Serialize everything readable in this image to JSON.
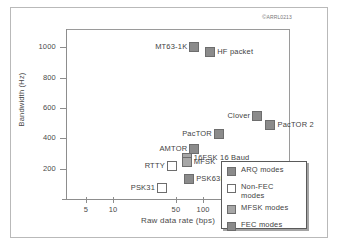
{
  "figure": {
    "copyright_mark": "©",
    "copyright_text": "ARRL0213"
  },
  "chart_data": {
    "type": "scatter",
    "title": "",
    "xlabel": "Raw data rate (bps)",
    "ylabel": "Bandwidth (Hz)",
    "x_scale": "log",
    "x_ticks": [
      "5",
      "10",
      "50",
      "100",
      "500"
    ],
    "y_ticks": [
      "200",
      "400",
      "600",
      "800",
      "1000"
    ],
    "ylim": [
      0,
      1120
    ],
    "xlim": [
      3,
      900
    ],
    "grid": false,
    "legend_position": "bottom-right",
    "points": [
      {
        "label": "MT63-1K",
        "x": 80,
        "y": 1000,
        "category": "FEC modes",
        "label_side": "left"
      },
      {
        "label": "HF packet",
        "x": 120,
        "y": 970,
        "category": "ARQ modes",
        "label_side": "right"
      },
      {
        "label": "Clover",
        "x": 400,
        "y": 550,
        "category": "ARQ modes",
        "label_side": "left"
      },
      {
        "label": "PacTOR 2",
        "x": 560,
        "y": 490,
        "category": "ARQ modes",
        "label_side": "right"
      },
      {
        "label": "PacTOR",
        "x": 150,
        "y": 430,
        "category": "ARQ modes",
        "label_side": "left"
      },
      {
        "label": "AMTOR",
        "x": 80,
        "y": 330,
        "category": "ARQ modes",
        "label_side": "left"
      },
      {
        "label": "16FSK 16 Baud",
        "x": 66,
        "y": 270,
        "category": "MFSK modes",
        "label_side": "right"
      },
      {
        "label": "MFSK",
        "x": 66,
        "y": 245,
        "category": "MFSK modes",
        "label_side": "right"
      },
      {
        "label": "RTTY",
        "x": 45,
        "y": 220,
        "category": "Non-FEC modes",
        "label_side": "left"
      },
      {
        "label": "PSK63F",
        "x": 70,
        "y": 130,
        "category": "FEC modes",
        "label_side": "right"
      },
      {
        "label": "PSK31",
        "x": 35,
        "y": 70,
        "category": "Non-FEC modes",
        "label_side": "left"
      }
    ],
    "legend": [
      {
        "label": "ARQ modes",
        "color": "#8b8b8b"
      },
      {
        "label": "Non-FEC\nmodes",
        "color": "#ffffff"
      },
      {
        "label": "MFSK modes",
        "color": "#a7a7a7"
      },
      {
        "label": "FEC modes",
        "color": "#8b8b8b"
      }
    ]
  }
}
